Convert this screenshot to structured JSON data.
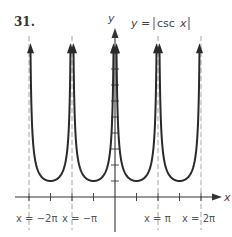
{
  "problem_number": "31.",
  "chart_data": {
    "type": "line",
    "function": "y = |csc x|",
    "xlabel": "x",
    "ylabel": "y",
    "x_unit": "pi",
    "xlim": [
      -2.4,
      2.4
    ],
    "ylim": [
      0,
      10
    ],
    "grid": false,
    "legend": null,
    "asymptotes": [
      {
        "x": -2,
        "label": "x = −2π"
      },
      {
        "x": -1,
        "label": "x = −π"
      },
      {
        "x": 0,
        "label": ""
      },
      {
        "x": 1,
        "label": "x = π"
      },
      {
        "x": 2,
        "label": "x = 2π"
      }
    ],
    "x_ticks_pi": [
      -1.5,
      -0.5,
      0.5,
      1.5
    ],
    "y_ticks": [
      1,
      2,
      3,
      4,
      5,
      6,
      7,
      8,
      9
    ],
    "branches": [
      {
        "from_pi": -2,
        "to_pi": -1,
        "min": {
          "x_pi": -1.5,
          "y": 1
        }
      },
      {
        "from_pi": -1,
        "to_pi": 0,
        "min": {
          "x_pi": -0.5,
          "y": 1
        }
      },
      {
        "from_pi": 0,
        "to_pi": 1,
        "min": {
          "x_pi": 0.5,
          "y": 1
        }
      },
      {
        "from_pi": 1,
        "to_pi": 2,
        "min": {
          "x_pi": 1.5,
          "y": 1
        }
      }
    ],
    "annotations": [
      "x = −2π",
      "x = −π",
      "x = π",
      "x = 2π"
    ]
  },
  "labels": {
    "title_prefix": "y = ",
    "title_func": "csc",
    "title_var": "x",
    "x_axis": "x",
    "y_axis": "y",
    "asym_neg2pi": "x = −2π",
    "asym_negpi": "x = −π",
    "asym_pi": "x = π",
    "asym_2pi": "x = 2π"
  },
  "colors": {
    "curve": "#2a2a2a",
    "axis": "#333333",
    "asymptote": "#9a9a9a"
  }
}
